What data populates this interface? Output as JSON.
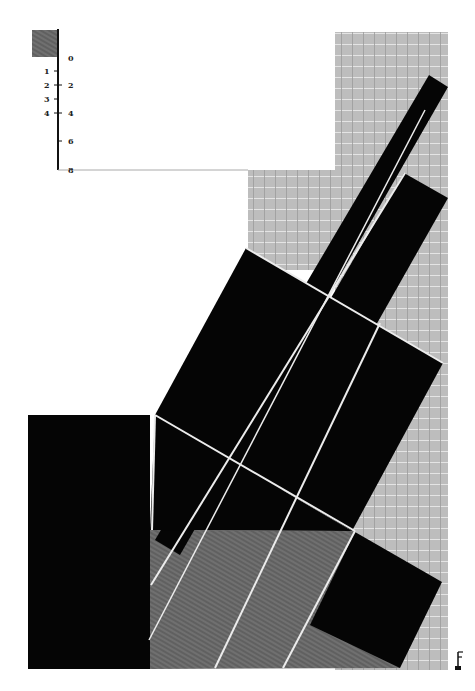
{
  "artwork": {
    "description": "Abstract suprematist composition of black rotated rectangles over grey grid field with scale bar",
    "colors": {
      "background": "#ffffff",
      "black": "#050505",
      "grid_grey": "#b8b8b8",
      "hatch_grey": "#6a6a6a",
      "line_white": "#e8e8e8"
    }
  },
  "scale_bar": {
    "left_labels": [
      "1",
      "2",
      "3",
      "4"
    ],
    "right_labels": [
      "0",
      "2",
      "4",
      "6",
      "8"
    ]
  },
  "corner_mark": {
    "glyph": "F"
  }
}
